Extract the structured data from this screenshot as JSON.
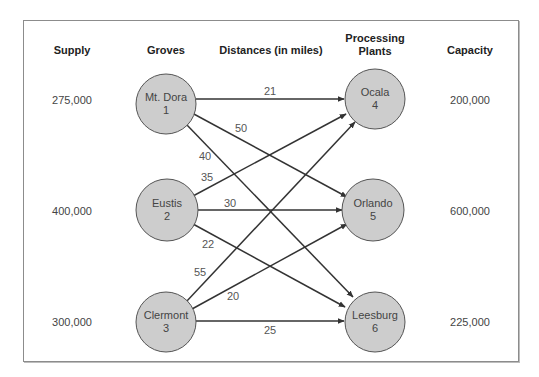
{
  "headers": {
    "supply": "Supply",
    "groves": "Groves",
    "distances": "Distances (in miles)",
    "plants_line1": "Processing",
    "plants_line2": "Plants",
    "capacity": "Capacity"
  },
  "groves": [
    {
      "name": "Mt. Dora",
      "id": "1",
      "supply": "275,000"
    },
    {
      "name": "Eustis",
      "id": "2",
      "supply": "400,000"
    },
    {
      "name": "Clermont",
      "id": "3",
      "supply": "300,000"
    }
  ],
  "plants": [
    {
      "name": "Ocala",
      "id": "4",
      "capacity": "200,000"
    },
    {
      "name": "Orlando",
      "id": "5",
      "capacity": "600,000"
    },
    {
      "name": "Leesburg",
      "id": "6",
      "capacity": "225,000"
    }
  ],
  "edges": [
    {
      "from": "Mt. Dora",
      "to": "Ocala",
      "distance": "21"
    },
    {
      "from": "Mt. Dora",
      "to": "Orlando",
      "distance": "50"
    },
    {
      "from": "Mt. Dora",
      "to": "Leesburg",
      "distance": "40"
    },
    {
      "from": "Eustis",
      "to": "Ocala",
      "distance": "35"
    },
    {
      "from": "Eustis",
      "to": "Orlando",
      "distance": "30"
    },
    {
      "from": "Eustis",
      "to": "Leesburg",
      "distance": "22"
    },
    {
      "from": "Clermont",
      "to": "Ocala",
      "distance": "55"
    },
    {
      "from": "Clermont",
      "to": "Orlando",
      "distance": "20"
    },
    {
      "from": "Clermont",
      "to": "Leesburg",
      "distance": "25"
    }
  ],
  "colors": {
    "node_fill": "#cdcdcd",
    "node_stroke": "#555555",
    "edge": "#333333",
    "border": "#8c8c8c"
  }
}
